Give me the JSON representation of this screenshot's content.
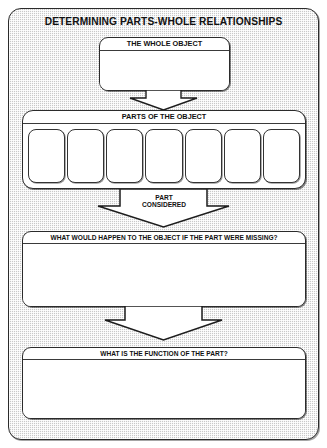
{
  "worksheet": {
    "title": "DETERMINING PARTS-WHOLE RELATIONSHIPS",
    "colors": {
      "panel_background": "#c9c9c9",
      "box_background": "#ffffff",
      "outline": "#2b2b2b",
      "text": "#111111",
      "page_background": "#ffffff"
    }
  },
  "whole_object": {
    "header": "THE WHOLE OBJECT",
    "value": "",
    "placeholder": ""
  },
  "parts": {
    "header": "PARTS OF THE OBJECT",
    "count": 7,
    "cells": [
      {
        "index": 1,
        "value": ""
      },
      {
        "index": 2,
        "value": ""
      },
      {
        "index": 3,
        "value": ""
      },
      {
        "index": 4,
        "value": ""
      },
      {
        "index": 5,
        "value": ""
      },
      {
        "index": 6,
        "value": ""
      },
      {
        "index": 7,
        "value": ""
      }
    ]
  },
  "part_considered": {
    "caption_line_1": "PART",
    "caption_line_2": "CONSIDERED"
  },
  "missing_part": {
    "header": "WHAT WOULD HAPPEN TO THE OBJECT IF THE PART WERE MISSING?",
    "value": "",
    "placeholder": ""
  },
  "function": {
    "header": "WHAT IS THE FUNCTION OF THE PART?",
    "value": "",
    "placeholder": ""
  },
  "arrows": [
    {
      "name": "whole-to-parts",
      "direction": "down"
    },
    {
      "name": "parts-to-missing",
      "direction": "down"
    },
    {
      "name": "missing-to-function",
      "direction": "down"
    }
  ]
}
